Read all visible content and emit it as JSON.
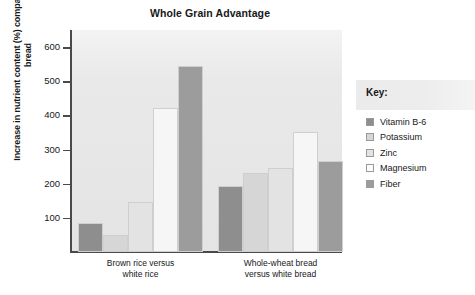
{
  "chart_data": {
    "type": "bar",
    "title": "Whole Grain Advantage",
    "xlabel": "",
    "ylabel": "Increase in nutrient content (%) compared to white bread",
    "ylim": [
      0,
      650
    ],
    "yticks": [
      100,
      200,
      300,
      400,
      500,
      600
    ],
    "ytick_labels": [
      "100",
      "200",
      "300",
      "400",
      "500",
      "600"
    ],
    "grid": false,
    "legend_position": "right",
    "legend_title": "Key:",
    "categories": [
      "Brown rice versus white rice",
      "Whole-wheat bread versus white bread"
    ],
    "category_lines": [
      [
        "Brown rice versus",
        "white rice"
      ],
      [
        "Whole-wheat bread",
        "versus white bread"
      ]
    ],
    "series": [
      {
        "name": "Vitamin B-6",
        "color": "#8e8e8e",
        "values": [
          85,
          192
        ]
      },
      {
        "name": "Potassium",
        "color": "#d6d6d6",
        "values": [
          50,
          230
        ]
      },
      {
        "name": "Zinc",
        "color": "#e3e3e3",
        "values": [
          147,
          245
        ]
      },
      {
        "name": "Magnesium",
        "color": "#f6f6f6",
        "values": [
          422,
          352
        ]
      },
      {
        "name": "Fiber",
        "color": "#9c9c9c",
        "values": [
          545,
          266
        ]
      }
    ]
  },
  "legend": {
    "title": "Key:",
    "items": [
      {
        "label": "Vitamin B-6",
        "color": "#8e8e8e"
      },
      {
        "label": "Potassium",
        "color": "#d6d6d6"
      },
      {
        "label": "Zinc",
        "color": "#e3e3e3"
      },
      {
        "label": "Magnesium",
        "color": "#fbfbfb"
      },
      {
        "label": "Fiber",
        "color": "#9c9c9c"
      }
    ]
  }
}
